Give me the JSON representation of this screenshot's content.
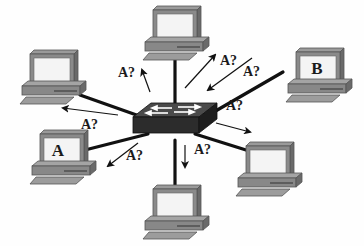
{
  "diagram": {
    "type": "network-broadcast",
    "colors": {
      "link": "#111111",
      "switch_top": "#4a4a4a",
      "switch_front": "#2a2a2a",
      "pc_body": "#8a8a8a",
      "pc_dark": "#5e5e5e",
      "screen": "#f4f4f4",
      "label": "#1a1a1a"
    },
    "switch": {
      "name": "switch",
      "x": 175,
      "y": 128
    },
    "hosts": [
      {
        "id": "top",
        "label": "",
        "x": 175,
        "y": 36
      },
      {
        "id": "top-right",
        "label": "B",
        "x": 318,
        "y": 78
      },
      {
        "id": "upper-left",
        "label": "",
        "x": 52,
        "y": 80
      },
      {
        "id": "left",
        "label": "A",
        "x": 62,
        "y": 160
      },
      {
        "id": "bottom",
        "label": "",
        "x": 175,
        "y": 215
      },
      {
        "id": "right",
        "label": "",
        "x": 268,
        "y": 172
      }
    ],
    "broadcasts": [
      {
        "text": "A?",
        "x": 118,
        "y": 77
      },
      {
        "text": "A?",
        "x": 220,
        "y": 65
      },
      {
        "text": "A?",
        "x": 243,
        "y": 76
      },
      {
        "text": "A?",
        "x": 81,
        "y": 129
      },
      {
        "text": "A?",
        "x": 226,
        "y": 110
      },
      {
        "text": "A?",
        "x": 126,
        "y": 160
      },
      {
        "text": "A?",
        "x": 196,
        "y": 154
      }
    ]
  }
}
